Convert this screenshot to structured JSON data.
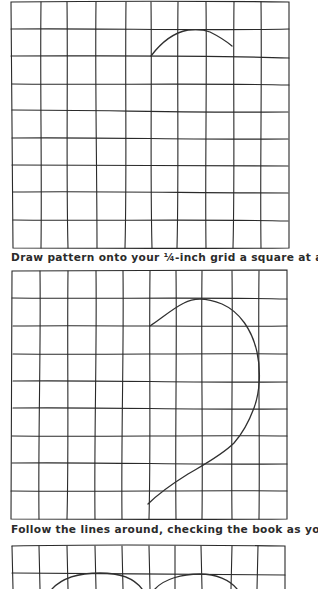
{
  "page": {
    "background": "#ffffff",
    "ink_color": "#2a2a2a"
  },
  "figures": [
    {
      "id": "grid-1",
      "top": 1,
      "columns": 10,
      "rows": 9,
      "curve": "M151,56 C160,44 172,33 188,30 C197,29 205,30 210,32 C218,36 226,41 232,46",
      "caption": null
    },
    {
      "id": "grid-2",
      "top": 270,
      "columns": 10,
      "rows": 9,
      "curve": "M150,326 C162,318 172,309 184,303 C195,297 207,298 222,304 C240,312 252,330 257,352 C261,370 260,392 254,408 C248,424 242,434 234,443 C222,455 205,464 188,474 C172,484 158,494 148,504",
      "caption": null
    },
    {
      "id": "grid-3",
      "top": 545,
      "columns": 10,
      "rows": 1,
      "curves": [
        "M52,589 C62,578 80,573 100,573 C118,573 134,578 142,589",
        "M155,589 C164,579 182,574 200,574 C216,574 230,580 237,589"
      ],
      "caption": null
    }
  ],
  "captions": [
    {
      "text": "Draw pattern onto your ¼-inch grid a square at a time.",
      "top": 251
    },
    {
      "text": "Follow the lines around, checking the book as you go.",
      "top": 523
    }
  ]
}
